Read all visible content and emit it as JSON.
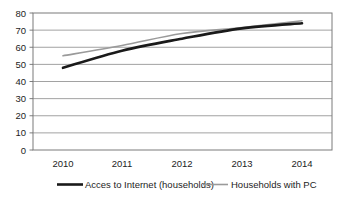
{
  "chart_data": {
    "type": "line",
    "title": "",
    "subtitle": "",
    "xlabel": "",
    "ylabel": "",
    "categories": [
      "2010",
      "2011",
      "2012",
      "2013",
      "2014"
    ],
    "x": [
      2010,
      2011,
      2012,
      2013,
      2014
    ],
    "series": [
      {
        "name": "Acces to Internet (households)",
        "values": [
          48,
          58,
          65,
          71,
          74
        ],
        "color": "#1a1a1a",
        "width": 2.6
      },
      {
        "name": "Households with PC",
        "values": [
          55,
          61,
          68,
          71.5,
          75.5
        ],
        "color": "#9a9a9a",
        "width": 1.6
      }
    ],
    "ylim": [
      0,
      80
    ],
    "y_ticks": [
      0,
      10,
      20,
      30,
      40,
      50,
      60,
      70,
      80
    ],
    "y_tick_labels": [
      "0",
      "10",
      "20",
      "30",
      "40",
      "50",
      "60",
      "70",
      "80"
    ],
    "x_tick_labels": [
      "2010",
      "2011",
      "2012",
      "2013",
      "2014"
    ],
    "grid": true,
    "grid_axis": "y",
    "legend_position": "bottom",
    "plot_bg": "#ffffff",
    "border_color": "#7a7a7a",
    "grid_color": "#8a8a8a"
  },
  "legend": {
    "items": [
      {
        "label": "Acces to Internet (households)",
        "color": "#1a1a1a",
        "swatch": "thick-line-swatch"
      },
      {
        "label": "Households with PC",
        "color": "#9a9a9a",
        "swatch": "thin-line-swatch"
      }
    ]
  },
  "axes": {
    "y_labels": [
      "80",
      "70",
      "60",
      "50",
      "40",
      "30",
      "20",
      "10",
      "0"
    ],
    "x_labels": [
      "2010",
      "2011",
      "2012",
      "2013",
      "2014"
    ]
  }
}
